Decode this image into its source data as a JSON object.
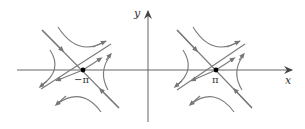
{
  "diagram": {
    "type": "phase-portrait",
    "axes": {
      "x_label": "x",
      "y_label": "y"
    },
    "equilibria": [
      {
        "label": "−π",
        "kind": "saddle",
        "x": -3.14159
      },
      {
        "label": "π",
        "kind": "saddle",
        "x": 3.14159
      }
    ],
    "colors": {
      "axis": "#555555",
      "trajectory": "#7a7a7a",
      "equilibrium_point": "#000000",
      "background": "#ffffff"
    }
  }
}
